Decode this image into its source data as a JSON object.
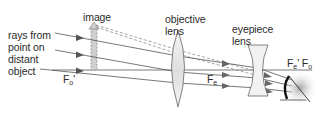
{
  "diagram": {
    "labels": {
      "rays_line1": "rays from",
      "rays_line2": "point on",
      "rays_line3": "distant",
      "rays_line4": "object",
      "image": "image",
      "objective_line1": "objective",
      "objective_line2": "lens",
      "eyepiece_line1": "eyepiece",
      "eyepiece_line2": "lens",
      "focal_obj_prime_base": "F",
      "focal_obj_prime_sub": "o",
      "focal_obj_prime_mark": "'",
      "focal_eye_base": "F",
      "focal_eye_sub": "e",
      "focal_right_e_base": "F",
      "focal_right_e_sub": "e",
      "focal_right_e_mark": "'",
      "focal_right_o_base": "F",
      "focal_right_o_sub": "o"
    },
    "colors": {
      "ray": "#555555",
      "dashed_ray": "#8a8a8a",
      "lens_fill": "#eeeeee",
      "lens_stroke": "#666666",
      "image_fill": "#cfcfcf",
      "text": "#2b2b2b"
    }
  }
}
